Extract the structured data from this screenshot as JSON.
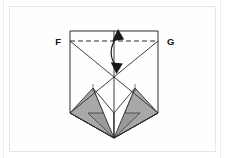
{
  "figure": {
    "type": "geometric-fold-diagram",
    "background_color": "#ffffff",
    "panel_border_color": "#e6e6e6",
    "stroke_color": "#2b2b2b",
    "shade_color": "#a8a8a8",
    "shade_color_dark": "#9a9a9a",
    "labels": [
      {
        "id": "F",
        "text": "F",
        "x": 62,
        "y": 44
      },
      {
        "id": "G",
        "text": "G",
        "x": 172,
        "y": 44
      }
    ],
    "outline": {
      "name": "paper-outline",
      "points": "70,31 158,31 158,113 114,138 70,113"
    },
    "crease_lines": [
      {
        "name": "crease-f-to-bottom-right",
        "x1": 70,
        "y1": 41,
        "x2": 158,
        "y2": 113
      },
      {
        "name": "crease-g-to-bottom-left",
        "x1": 158,
        "y1": 41,
        "x2": 70,
        "y2": 113
      },
      {
        "name": "crease-center-vertical",
        "x1": 114,
        "y1": 31,
        "x2": 114,
        "y2": 138
      },
      {
        "name": "crease-left-to-apex",
        "x1": 70,
        "y1": 113,
        "x2": 114,
        "y2": 138
      },
      {
        "name": "crease-right-to-apex",
        "x1": 158,
        "y1": 113,
        "x2": 114,
        "y2": 138
      }
    ],
    "dashed_line": {
      "name": "fold-line-FG",
      "x1": 70,
      "y1": 41,
      "x2": 158,
      "y2": 41,
      "dash": "5,3"
    },
    "shaded_regions": [
      {
        "name": "shaded-flap-left",
        "points": "70,113 93,88 114,138"
      },
      {
        "name": "shaded-flap-right",
        "points": "158,113 135,88 114,138"
      }
    ],
    "white_regions": [
      {
        "name": "white-flap-left",
        "points": "93,88 114,113 114,138"
      },
      {
        "name": "white-flap-right",
        "points": "135,88 114,113 114,138"
      }
    ],
    "tick_marks": [
      {
        "name": "tick-left",
        "x1": 93,
        "y1": 84,
        "x2": 93,
        "y2": 92
      },
      {
        "name": "tick-right",
        "x1": 135,
        "y1": 84,
        "x2": 135,
        "y2": 92
      }
    ],
    "arrow": {
      "name": "double-headed-fold-arrow",
      "path": "M 118,35 C 110,46 110,58 117,68",
      "head_top": "118,30 113.5,39 122.5,38.5",
      "head_bottom": "117,73 112.5,63 121.5,63.5",
      "color": "#1a1a1a"
    }
  }
}
